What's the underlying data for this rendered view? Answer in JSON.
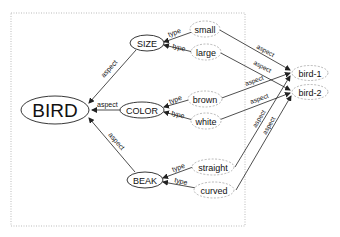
{
  "diagram": {
    "root": {
      "label": "BIRD"
    },
    "aspects": [
      {
        "label": "SIZE",
        "edge_label": "aspect"
      },
      {
        "label": "COLOR",
        "edge_label": "aspect"
      },
      {
        "label": "BEAK",
        "edge_label": "aspect"
      }
    ],
    "values": [
      {
        "label": "small",
        "aspect": "SIZE",
        "edge_label": "type"
      },
      {
        "label": "large",
        "aspect": "SIZE",
        "edge_label": "type"
      },
      {
        "label": "brown",
        "aspect": "COLOR",
        "edge_label": "type"
      },
      {
        "label": "white",
        "aspect": "COLOR",
        "edge_label": "type"
      },
      {
        "label": "straight",
        "aspect": "BEAK",
        "edge_label": "type"
      },
      {
        "label": "curved",
        "aspect": "BEAK",
        "edge_label": "type"
      }
    ],
    "instances": [
      {
        "label": "bird-1"
      },
      {
        "label": "bird-2"
      }
    ],
    "instance_edges": [
      {
        "from": "small",
        "to": "bird-1",
        "label": "aspect"
      },
      {
        "from": "large",
        "to": "bird-2",
        "label": "aspect"
      },
      {
        "from": "brown",
        "to": "bird-1",
        "label": "aspect"
      },
      {
        "from": "white",
        "to": "bird-2",
        "label": "aspect"
      },
      {
        "from": "straight",
        "to": "bird-1",
        "label": "aspect"
      },
      {
        "from": "curved",
        "to": "bird-2",
        "label": "aspect"
      }
    ]
  },
  "colors": {
    "line": "#222222",
    "dashed_node": "#999999",
    "frame": "#bbbbbb"
  }
}
